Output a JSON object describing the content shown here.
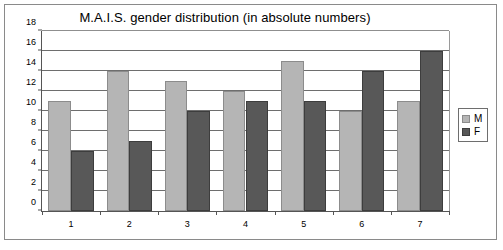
{
  "chart_data": {
    "type": "bar",
    "title": "M.A.I.S. gender distribution (in absolute numbers)",
    "xlabel": "",
    "ylabel": "",
    "categories": [
      "1",
      "2",
      "3",
      "4",
      "5",
      "6",
      "7"
    ],
    "series": [
      {
        "name": "M",
        "color": "#b5b5b5",
        "values": [
          11,
          14,
          13,
          12,
          15,
          10,
          11
        ]
      },
      {
        "name": "F",
        "color": "#585858",
        "values": [
          6,
          7,
          10,
          11,
          11,
          14,
          16
        ]
      }
    ],
    "ylim": [
      0,
      18
    ],
    "ytick_step": 2,
    "yticks": [
      0,
      2,
      4,
      6,
      8,
      10,
      12,
      14,
      16,
      18
    ],
    "ytick_labels": [
      "0",
      "2",
      "4",
      "6",
      "8",
      "10",
      "12",
      "14",
      "16",
      "18"
    ],
    "grid": true,
    "grid_axis": "y",
    "legend_position": "right",
    "legend_entries": [
      "M",
      "F"
    ],
    "frame": true,
    "background": "#ffffff"
  }
}
